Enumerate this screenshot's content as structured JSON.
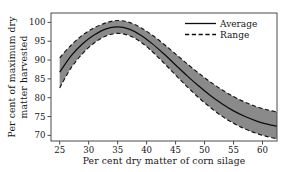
{
  "chart_data": {
    "type": "area",
    "title": "",
    "subtitle": "",
    "xlabel": "Per cent dry matter of corn silage",
    "ylabel": "Per cent of maximum dry matter harvested",
    "ylabel_line1": "Per cent of maximum dry",
    "ylabel_line2": "matter harvested",
    "xlim": [
      23.5,
      62.5
    ],
    "ylim": [
      68.5,
      102.5
    ],
    "xticks": [
      25,
      30,
      35,
      40,
      45,
      50,
      55,
      60
    ],
    "yticks": [
      70,
      75,
      80,
      85,
      90,
      95,
      100
    ],
    "xtick_labels": [
      "25",
      "30",
      "35",
      "40",
      "45",
      "50",
      "55",
      "60"
    ],
    "ytick_labels": [
      "70",
      "75",
      "80",
      "85",
      "90",
      "95",
      "100"
    ],
    "grid": false,
    "legend_position": "top-right",
    "legend": [
      "Average",
      "Range"
    ],
    "x": [
      25,
      27,
      29,
      31,
      33,
      35,
      37,
      39,
      41,
      43,
      45,
      47,
      49,
      51,
      53,
      55,
      57,
      59,
      61,
      62.5
    ],
    "series": [
      {
        "name": "Average",
        "style": "solid",
        "color": "#0d0d0d",
        "values": [
          86.8,
          91.2,
          94.4,
          96.7,
          98.3,
          98.8,
          98.2,
          96.6,
          94.3,
          91.6,
          88.7,
          85.8,
          83.1,
          80.6,
          78.4,
          76.5,
          75.0,
          73.8,
          72.9,
          72.4
        ]
      },
      {
        "name": "Range upper",
        "style": "dashed",
        "color": "#141414",
        "values": [
          90.6,
          94.0,
          96.7,
          98.6,
          99.9,
          100.5,
          100.0,
          98.6,
          96.6,
          94.2,
          91.6,
          89.0,
          86.5,
          84.2,
          82.1,
          80.3,
          78.8,
          77.6,
          76.7,
          76.2
        ]
      },
      {
        "name": "Range lower",
        "style": "dashed",
        "color": "#141414",
        "values": [
          82.6,
          88.0,
          91.8,
          94.6,
          96.4,
          97.1,
          96.5,
          94.8,
          92.2,
          89.2,
          86.0,
          82.9,
          80.0,
          77.4,
          75.1,
          73.2,
          71.7,
          70.5,
          69.6,
          69.1
        ]
      }
    ],
    "band": {
      "fill_color": "#8a8a8a",
      "upper_series": "Range upper",
      "lower_series": "Range lower"
    }
  },
  "legend_items": [
    {
      "label": "Average",
      "style": "solid"
    },
    {
      "label": "Range",
      "style": "dashed"
    }
  ]
}
